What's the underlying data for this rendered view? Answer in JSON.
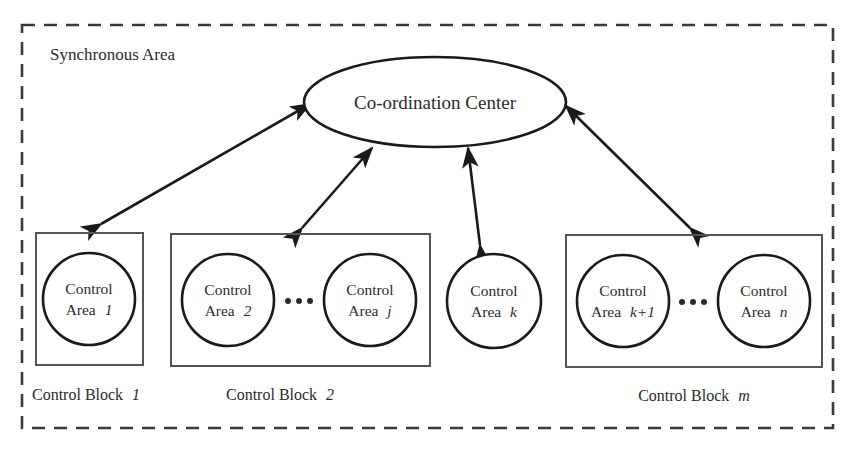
{
  "figure": {
    "container_label": "Synchronous Area",
    "center_node": "Co-ordination Center",
    "ellipsis": "· · ·",
    "colors": {
      "background": "#ffffff",
      "outline": "#1a1a1a",
      "box_outline": "#555555",
      "dashed_outline": "#3a3a3a",
      "text": "#2b2b2b"
    }
  },
  "blocks": [
    {
      "id": "block-1",
      "label_prefix": "Control Block",
      "label_index": "1",
      "boxed": true,
      "areas": [
        {
          "id": "area-1",
          "line1": "Control",
          "line2_prefix": "Area",
          "line2_index": "1"
        }
      ],
      "has_ellipsis": false
    },
    {
      "id": "block-2",
      "label_prefix": "Control Block",
      "label_index": "2",
      "boxed": true,
      "areas": [
        {
          "id": "area-2",
          "line1": "Control",
          "line2_prefix": "Area",
          "line2_index": "2"
        },
        {
          "id": "area-j",
          "line1": "Control",
          "line2_prefix": "Area",
          "line2_index": "j"
        }
      ],
      "has_ellipsis": true
    },
    {
      "id": "block-k",
      "label_prefix": "",
      "label_index": "",
      "boxed": false,
      "areas": [
        {
          "id": "area-k",
          "line1": "Control",
          "line2_prefix": "Area",
          "line2_index": "k"
        }
      ],
      "has_ellipsis": false
    },
    {
      "id": "block-m",
      "label_prefix": "Control Block",
      "label_index": "m",
      "boxed": true,
      "areas": [
        {
          "id": "area-k-plus-1",
          "line1": "Control",
          "line2_prefix": "Area",
          "line2_index": "k+1"
        },
        {
          "id": "area-n",
          "line1": "Control",
          "line2_prefix": "Area",
          "line2_index": "n"
        }
      ],
      "has_ellipsis": true
    }
  ],
  "connections": [
    {
      "id": "conn-center-block1",
      "from": "Co-ordination Center",
      "to": "Control Block 1",
      "style": "double-arrow"
    },
    {
      "id": "conn-center-block2",
      "from": "Co-ordination Center",
      "to": "Control Block 2",
      "style": "double-arrow"
    },
    {
      "id": "conn-center-areak",
      "from": "Co-ordination Center",
      "to": "Control Area k",
      "style": "double-arrow"
    },
    {
      "id": "conn-center-blockm",
      "from": "Co-ordination Center",
      "to": "Control Block m",
      "style": "double-arrow"
    }
  ]
}
